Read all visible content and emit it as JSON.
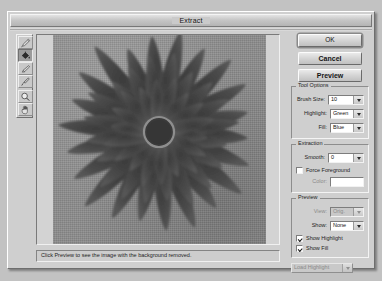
{
  "window": {
    "title": "Extract"
  },
  "toolbar": {
    "tools": [
      {
        "name": "edge-highlighter-tool",
        "icon": "highlighter-icon",
        "selected": false
      },
      {
        "name": "fill-tool",
        "icon": "paint-bucket-icon",
        "selected": true
      },
      {
        "name": "eraser-tool",
        "icon": "eraser-icon",
        "selected": false
      },
      {
        "name": "eyedropper-tool",
        "icon": "eyedropper-icon",
        "selected": false
      },
      {
        "name": "zoom-tool",
        "icon": "magnifier-icon",
        "selected": false
      },
      {
        "name": "hand-tool",
        "icon": "hand-icon",
        "selected": false
      }
    ]
  },
  "buttons": {
    "ok": "OK",
    "cancel": "Cancel",
    "preview": "Preview"
  },
  "tool_options": {
    "legend": "Tool Options",
    "brush_size_label": "Brush Size:",
    "brush_size_value": "10",
    "highlight_label": "Highlight:",
    "highlight_value": "Green",
    "fill_label": "Fill:",
    "fill_value": "Blue"
  },
  "extraction": {
    "legend": "Extraction",
    "smooth_label": "Smooth:",
    "smooth_value": "0",
    "force_foreground_label": "Force Foreground",
    "force_foreground_checked": false,
    "color_label": "Color:",
    "color_value": "#ffffff"
  },
  "preview": {
    "legend": "Preview",
    "view_label": "View:",
    "view_value": "Orig.",
    "show_label": "Show:",
    "show_value": "None",
    "show_highlight_label": "Show Highlight",
    "show_highlight_checked": true,
    "show_fill_label": "Show Fill",
    "show_fill_checked": true
  },
  "load_highlight": {
    "label": "Load Highlight"
  },
  "status": {
    "message": "Click Preview to see the image with the background removed."
  },
  "image": {
    "subject": "dark gerbera daisy flower on gray background",
    "background_color": "#8e8e8e",
    "petal_color": "#4a4a4a",
    "center_color": "#3a3a3a"
  }
}
